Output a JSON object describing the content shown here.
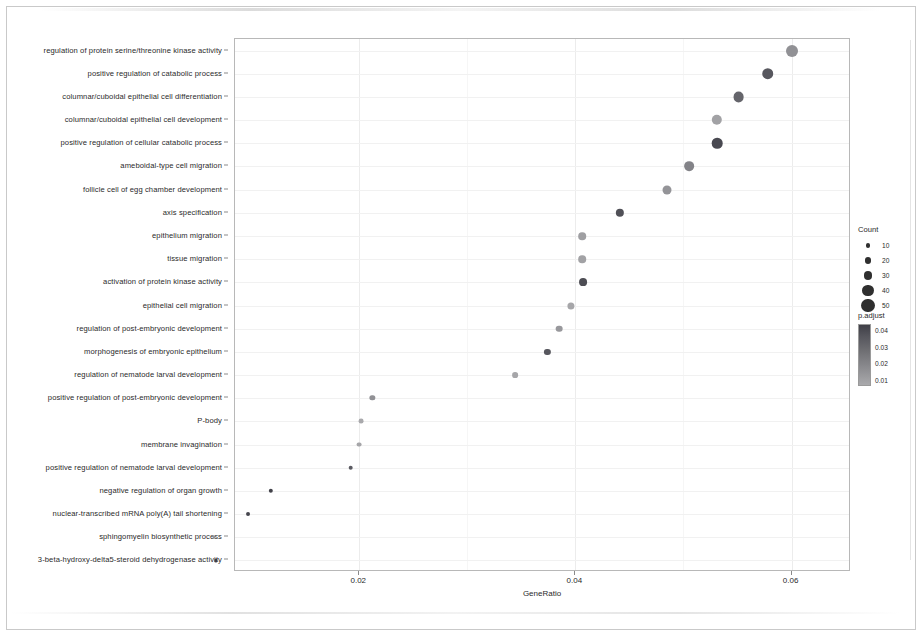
{
  "chart_data": {
    "type": "scatter",
    "title": "",
    "xlabel": "GeneRatio",
    "ylabel": "",
    "xlim": [
      0.0085,
      0.0655
    ],
    "xticks": [
      0.02,
      0.04,
      0.06
    ],
    "xticklabels": [
      "0.02",
      "0.04",
      "0.06"
    ],
    "grid": true,
    "legend_position": "right",
    "size_legend": {
      "title": "Count",
      "values": [
        10,
        20,
        30,
        40,
        50
      ],
      "labels": [
        "10",
        "20",
        "30",
        "40",
        "50"
      ]
    },
    "color_legend": {
      "title": "p.adjust",
      "values": [
        0.04,
        0.03,
        0.02,
        0.01
      ],
      "labels": [
        "0.04",
        "0.03",
        "0.02",
        "0.01"
      ],
      "high_color": "#a9a9ac",
      "low_color": "#3f3f47"
    },
    "categories": [
      "regulation of protein serine/threonine kinase activity",
      "positive regulation of catabolic process",
      "columnar/cuboidal epithelial cell differentiation",
      "columnar/cuboidal epithelial cell development",
      "positive regulation of cellular catabolic process",
      "ameboidal-type cell migration",
      "follicle cell of egg chamber development",
      "axis specification",
      "epithelium migration",
      "tissue migration",
      "activation of protein kinase activity",
      "epithelial cell migration",
      "regulation of post-embryonic development",
      "morphogenesis of embryonic epithelium",
      "regulation of nematode larval development",
      "positive regulation of post-embryonic development",
      "P-body",
      "membrane invagination",
      "positive regulation of nematode larval development",
      "negative regulation of organ growth",
      "nuclear-transcribed mRNA poly(A) tail shortening",
      "sphingomyelin biosynthetic process",
      "3-beta-hydroxy-delta5-steroid dehydrogenase activity"
    ],
    "points": [
      {
        "term": "regulation of protein serine/threonine kinase activity",
        "gene_ratio": 0.06,
        "count": 44,
        "p_adjust": 0.029
      },
      {
        "term": "positive regulation of catabolic process",
        "gene_ratio": 0.0578,
        "count": 42,
        "p_adjust": 0.012
      },
      {
        "term": "columnar/cuboidal epithelial cell differentiation",
        "gene_ratio": 0.0551,
        "count": 39,
        "p_adjust": 0.016
      },
      {
        "term": "columnar/cuboidal epithelial cell development",
        "gene_ratio": 0.0531,
        "count": 37,
        "p_adjust": 0.034
      },
      {
        "term": "positive regulation of cellular catabolic process",
        "gene_ratio": 0.0531,
        "count": 38,
        "p_adjust": 0.008
      },
      {
        "term": "ameboidal-type cell migration",
        "gene_ratio": 0.0505,
        "count": 34,
        "p_adjust": 0.025
      },
      {
        "term": "follicle cell of egg chamber development",
        "gene_ratio": 0.0485,
        "count": 31,
        "p_adjust": 0.03
      },
      {
        "term": "axis specification",
        "gene_ratio": 0.0441,
        "count": 28,
        "p_adjust": 0.01
      },
      {
        "term": "epithelium migration",
        "gene_ratio": 0.0406,
        "count": 25,
        "p_adjust": 0.033
      },
      {
        "term": "tissue migration",
        "gene_ratio": 0.0406,
        "count": 25,
        "p_adjust": 0.034
      },
      {
        "term": "activation of protein kinase activity",
        "gene_ratio": 0.0407,
        "count": 26,
        "p_adjust": 0.009
      },
      {
        "term": "epithelial cell migration",
        "gene_ratio": 0.0396,
        "count": 23,
        "p_adjust": 0.035
      },
      {
        "term": "regulation of post-embryonic development",
        "gene_ratio": 0.0385,
        "count": 21,
        "p_adjust": 0.031
      },
      {
        "term": "morphogenesis of embryonic epithelium",
        "gene_ratio": 0.0374,
        "count": 19,
        "p_adjust": 0.012
      },
      {
        "term": "regulation of nematode larval development",
        "gene_ratio": 0.0344,
        "count": 17,
        "p_adjust": 0.035
      },
      {
        "term": "positive regulation of post-embryonic development",
        "gene_ratio": 0.0212,
        "count": 15,
        "p_adjust": 0.029
      },
      {
        "term": "P-body",
        "gene_ratio": 0.0202,
        "count": 13,
        "p_adjust": 0.036
      },
      {
        "term": "membrane invagination",
        "gene_ratio": 0.02,
        "count": 13,
        "p_adjust": 0.035
      },
      {
        "term": "positive regulation of nematode larval development",
        "gene_ratio": 0.0192,
        "count": 12,
        "p_adjust": 0.013
      },
      {
        "term": "negative regulation of organ growth",
        "gene_ratio": 0.0118,
        "count": 11,
        "p_adjust": 0.006
      },
      {
        "term": "nuclear-transcribed mRNA poly(A) tail shortening",
        "gene_ratio": 0.0097,
        "count": 9,
        "p_adjust": 0.007
      },
      {
        "term": "sphingomyelin biosynthetic process",
        "gene_ratio": 0.0066,
        "count": 5,
        "p_adjust": 0.03
      },
      {
        "term": "3-beta-hydroxy-delta5-steroid dehydrogenase activity",
        "gene_ratio": 0.0067,
        "count": 6,
        "p_adjust": 0.005
      }
    ]
  }
}
